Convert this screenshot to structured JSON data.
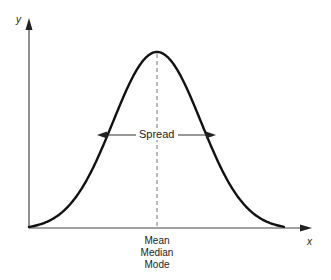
{
  "diagram": {
    "axes": {
      "x_label": "x",
      "y_label": "y"
    },
    "spread_label": "Spread",
    "center_labels": [
      "Mean",
      "Median",
      "Mode"
    ],
    "colors": {
      "line": "#111111",
      "axis": "#444444",
      "text": "#222222",
      "background": "#ffffff"
    }
  }
}
